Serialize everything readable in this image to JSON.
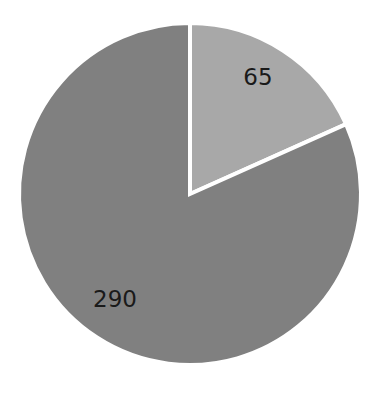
{
  "chart_data": {
    "type": "pie",
    "title": "",
    "subtitle": "",
    "xlabel": "",
    "ylabel": "",
    "legend_position": "none",
    "grid": false,
    "total": 355,
    "start_angle_deg": 0,
    "direction": "clockwise",
    "categories": [
      "65",
      "290"
    ],
    "values": [
      65,
      290
    ],
    "labels": [
      "65",
      "290"
    ],
    "percentages": [
      18.3,
      81.7
    ],
    "slices": [
      {
        "label": "65",
        "value": 65,
        "percent": 18.3,
        "color": "#a8a8a8",
        "start_angle_deg": 0,
        "end_angle_deg": 65.9,
        "label_x": 258,
        "label_y": 78
      },
      {
        "label": "290",
        "value": 290,
        "percent": 81.7,
        "color": "#808080",
        "start_angle_deg": 65.9,
        "end_angle_deg": 360,
        "label_x": 115,
        "label_y": 300
      }
    ],
    "geometry": {
      "center_x": 190,
      "center_y": 194,
      "radius": 171
    },
    "style": {
      "background": "#ffffff",
      "separator_color": "#ffffff",
      "separator_width": 4,
      "label_color": "#1a1a1a",
      "label_font_size": 23
    }
  }
}
